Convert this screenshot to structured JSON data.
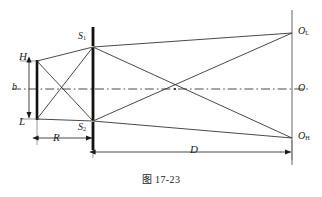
{
  "figure": {
    "caption_prefix": "图",
    "caption_number": "17-23",
    "caption_full": "图 17-23",
    "background_color": "#ffffff",
    "line_color": "#1a1a1a"
  },
  "labels": {
    "source_top": "H",
    "source_bottom": "L",
    "source_height": "b",
    "distance_source_to_slits": "R",
    "distance_slits_to_screen": "D",
    "slit_upper": "S",
    "slit_upper_sub": "1",
    "slit_lower": "S",
    "slit_lower_sub": "2",
    "screen_point_upper": "O",
    "screen_point_upper_sub": "L",
    "screen_point_center": "O",
    "screen_point_lower": "O",
    "screen_point_lower_sub": "H"
  },
  "geometry": {
    "source_bar": {
      "x": 37,
      "y_top": 61,
      "y_bottom": 119
    },
    "slit_bar": {
      "x": 93,
      "y_top": 27,
      "y_bottom": 150
    },
    "screen_bar": {
      "x": 292,
      "y_top": 10,
      "y_bottom": 165
    },
    "slit_upper_point": {
      "x": 93,
      "y": 47
    },
    "slit_lower_point": {
      "x": 93,
      "y": 121
    },
    "screen_upper_point": {
      "x": 292,
      "y": 33
    },
    "screen_center_point": {
      "x": 292,
      "y": 89
    },
    "screen_lower_point": {
      "x": 292,
      "y": 138
    },
    "axis_y": 89,
    "ray_crossing": {
      "x": 175,
      "y": 89
    },
    "dimension_R": {
      "x_start": 37,
      "x_end": 93,
      "y": 138
    },
    "dimension_D": {
      "x_start": 96,
      "x_end": 292,
      "y": 152
    },
    "dimension_b": {
      "x": 29,
      "y_top": 61,
      "y_bottom": 119
    }
  }
}
